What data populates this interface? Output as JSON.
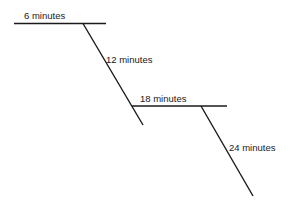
{
  "diagram": {
    "type": "staircase-timeline",
    "line_color": "#1a1a1a",
    "labels": [
      {
        "id": "step1",
        "text": "6 minutes"
      },
      {
        "id": "step2",
        "text": "12 minutes"
      },
      {
        "id": "step3",
        "text": "18 minutes"
      },
      {
        "id": "step4",
        "text": "24 minutes"
      }
    ]
  }
}
